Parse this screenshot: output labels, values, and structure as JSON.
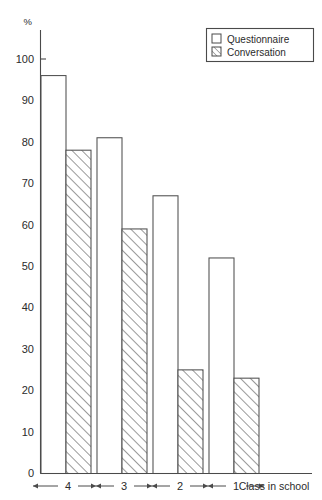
{
  "chart_data": {
    "type": "bar",
    "title": "",
    "subtitle": "",
    "xlabel": "Class in school",
    "ylabel": "%",
    "categories": [
      "4",
      "3",
      "2",
      "1"
    ],
    "series": [
      {
        "name": "Questionnaire",
        "values": [
          96,
          81,
          67,
          52
        ],
        "style": "open"
      },
      {
        "name": "Conversation",
        "values": [
          78,
          59,
          25,
          23
        ],
        "style": "hatched"
      }
    ],
    "ylim": [
      0,
      105
    ],
    "yticks": [
      0,
      10,
      20,
      30,
      40,
      50,
      60,
      70,
      80,
      90,
      100
    ],
    "ytick_labels": [
      "0",
      "10",
      "20",
      "30",
      "40",
      "50",
      "60",
      "70",
      "80",
      "90",
      "100"
    ],
    "grid": false,
    "legend_position": "top-right",
    "legend_entries": [
      "Questionnaire",
      "Conversation"
    ],
    "colors": {
      "axis": "#4a4a4a",
      "bar_outline": "#4f4f4f",
      "bar_open_fill": "#ffffff",
      "hatch": "#4f4f4f",
      "text": "#2b2b2b",
      "background": "#ffffff"
    }
  },
  "axes": {
    "y_unit_label": "%",
    "x_axis_title": "Class in school"
  },
  "legend": {
    "items": [
      {
        "label": "Questionnaire",
        "swatch": "open-square-icon"
      },
      {
        "label": "Conversation",
        "swatch": "hatched-square-icon"
      }
    ]
  },
  "ticks": {
    "y": [
      "100",
      "90",
      "80",
      "70",
      "60",
      "50",
      "40",
      "30",
      "20",
      "10",
      "0"
    ],
    "x": [
      "4",
      "3",
      "2",
      "1"
    ]
  }
}
